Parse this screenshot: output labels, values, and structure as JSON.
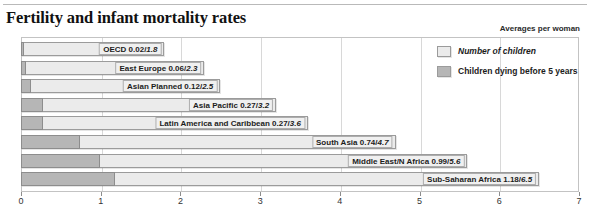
{
  "chart_data": {
    "type": "bar",
    "title": "Fertility and infant mortality rates",
    "subtitle": "Averages per woman",
    "xlabel": "",
    "ylabel": "",
    "xlim": [
      0,
      7
    ],
    "xticks": [
      0,
      1,
      2,
      3,
      4,
      5,
      6,
      7
    ],
    "xtick_labels": [
      "0",
      "1",
      "2",
      "3",
      "4",
      "5",
      "6",
      "7"
    ],
    "grid": true,
    "orientation": "horizontal",
    "legend_position": "top-right",
    "legend": [
      {
        "name": "Number of children",
        "color": "#ebebeb",
        "style": "italic"
      },
      {
        "name": "Children dying before 5 years",
        "color": "#b6b6b6",
        "style": "normal"
      }
    ],
    "categories": [
      "OECD",
      "East Europe",
      "Asian Planned",
      "Asia Pacific",
      "Latin America and Caribbean",
      "South Asia",
      "Middle East/N Africa",
      "Sub-Saharan Africa"
    ],
    "series": [
      {
        "name": "Number of children",
        "values": [
          1.8,
          2.3,
          2.5,
          3.2,
          3.6,
          4.7,
          5.6,
          6.5
        ]
      },
      {
        "name": "Children dying before 5 years",
        "values": [
          0.02,
          0.06,
          0.12,
          0.27,
          0.27,
          0.74,
          0.99,
          1.18
        ]
      }
    ],
    "bars": [
      {
        "category": "OECD",
        "deaths": 0.02,
        "children": 1.8,
        "label_main": "OECD 0.02/",
        "label_sub": "1.8"
      },
      {
        "category": "East Europe",
        "deaths": 0.06,
        "children": 2.3,
        "label_main": "East Europe 0.06/",
        "label_sub": "2.3"
      },
      {
        "category": "Asian Planned",
        "deaths": 0.12,
        "children": 2.5,
        "label_main": "Asian Planned 0.12/",
        "label_sub": "2.5"
      },
      {
        "category": "Asia Pacific",
        "deaths": 0.27,
        "children": 3.2,
        "label_main": "Asia Pacific 0.27/",
        "label_sub": "3.2"
      },
      {
        "category": "Latin America and Caribbean",
        "deaths": 0.27,
        "children": 3.6,
        "label_main": "Latin America and Caribbean 0.27/",
        "label_sub": "3.6"
      },
      {
        "category": "South Asia",
        "deaths": 0.74,
        "children": 4.7,
        "label_main": "South Asia 0.74/",
        "label_sub": "4.7"
      },
      {
        "category": "Middle East/N Africa",
        "deaths": 0.99,
        "children": 5.6,
        "label_main": "Middle East/N Africa 0.99/",
        "label_sub": "5.6"
      },
      {
        "category": "Sub-Saharan Africa",
        "deaths": 1.18,
        "children": 6.5,
        "label_main": "Sub-Saharan Africa 1.18/",
        "label_sub": "6.5"
      }
    ],
    "colors": {
      "bar_light": "#ebebeb",
      "bar_dark": "#b6b6b6",
      "bar_border": "#9b9b9b",
      "grid": "#d8d8d8",
      "frame": "#c3c3c3",
      "text": "#1c1c1c"
    }
  }
}
